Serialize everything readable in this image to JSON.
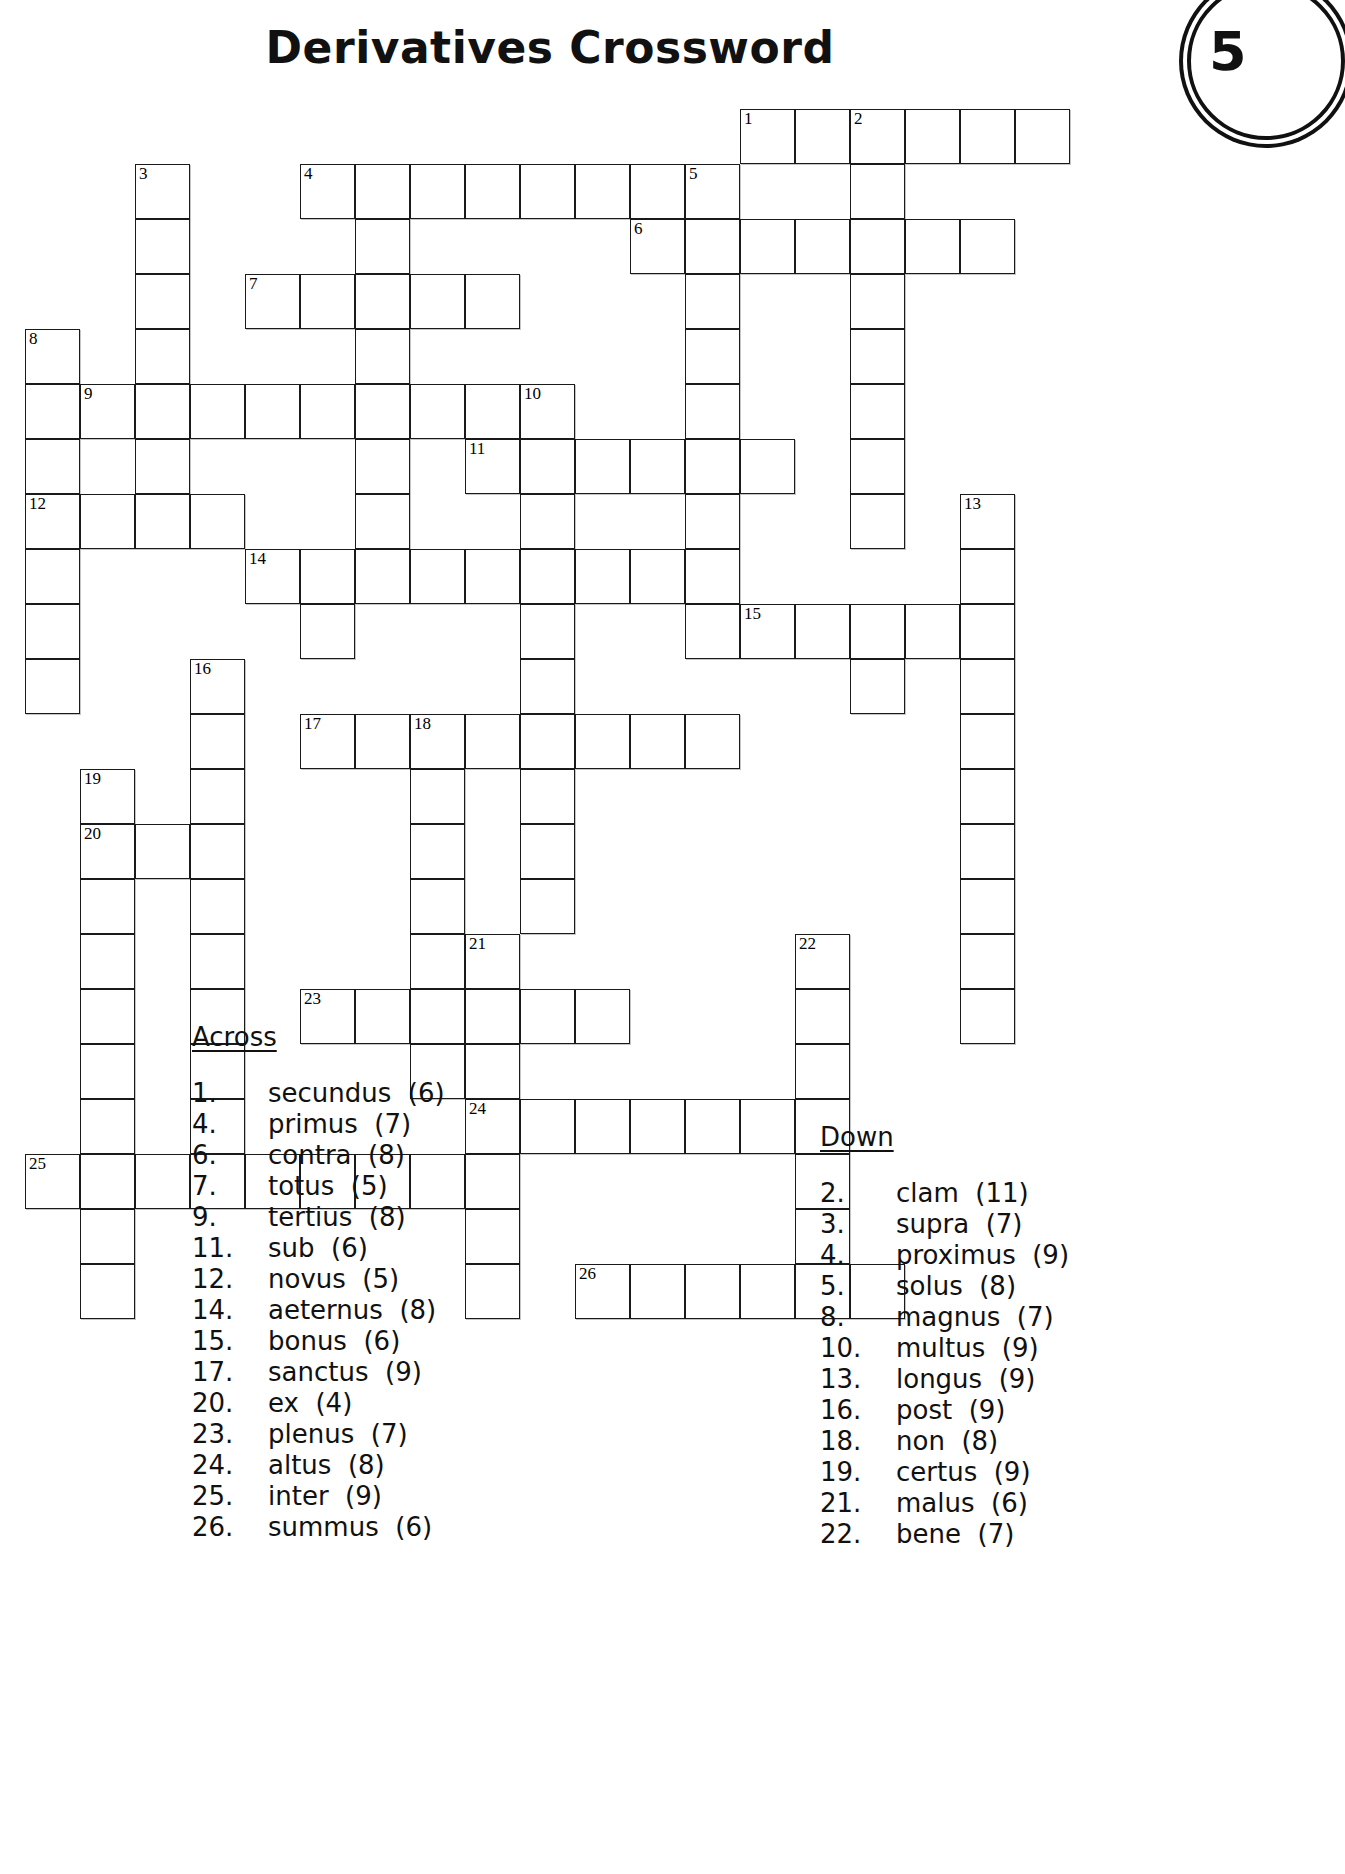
{
  "title": "Derivatives Crossword",
  "page_badge": "5",
  "headings": {
    "across": "Across",
    "down": "Down"
  },
  "grid": {
    "cell_size": 55,
    "origin": {
      "x": 25,
      "y": 109
    },
    "cells": [
      {
        "c": 13,
        "r": 0,
        "n": "1"
      },
      {
        "c": 14,
        "r": 0
      },
      {
        "c": 15,
        "r": 0,
        "n": "2"
      },
      {
        "c": 16,
        "r": 0
      },
      {
        "c": 17,
        "r": 0
      },
      {
        "c": 18,
        "r": 0
      },
      {
        "c": 2,
        "r": 1,
        "n": "3"
      },
      {
        "c": 5,
        "r": 1,
        "n": "4"
      },
      {
        "c": 6,
        "r": 1
      },
      {
        "c": 7,
        "r": 1
      },
      {
        "c": 8,
        "r": 1
      },
      {
        "c": 9,
        "r": 1
      },
      {
        "c": 10,
        "r": 1
      },
      {
        "c": 11,
        "r": 1
      },
      {
        "c": 12,
        "r": 1,
        "n": "5"
      },
      {
        "c": 15,
        "r": 1
      },
      {
        "c": 2,
        "r": 2
      },
      {
        "c": 6,
        "r": 2
      },
      {
        "c": 11,
        "r": 2,
        "n": "6"
      },
      {
        "c": 12,
        "r": 2
      },
      {
        "c": 13,
        "r": 2
      },
      {
        "c": 14,
        "r": 2
      },
      {
        "c": 15,
        "r": 2
      },
      {
        "c": 16,
        "r": 2
      },
      {
        "c": 17,
        "r": 2
      },
      {
        "c": 2,
        "r": 3
      },
      {
        "c": 4,
        "r": 3,
        "n": "7"
      },
      {
        "c": 5,
        "r": 3
      },
      {
        "c": 6,
        "r": 3
      },
      {
        "c": 7,
        "r": 3
      },
      {
        "c": 8,
        "r": 3
      },
      {
        "c": 12,
        "r": 3
      },
      {
        "c": 15,
        "r": 3
      },
      {
        "c": 0,
        "r": 4,
        "n": "8"
      },
      {
        "c": 2,
        "r": 4
      },
      {
        "c": 6,
        "r": 4
      },
      {
        "c": 12,
        "r": 4
      },
      {
        "c": 15,
        "r": 4
      },
      {
        "c": 0,
        "r": 5
      },
      {
        "c": 1,
        "r": 5,
        "n": "9"
      },
      {
        "c": 2,
        "r": 5
      },
      {
        "c": 3,
        "r": 5
      },
      {
        "c": 4,
        "r": 5
      },
      {
        "c": 5,
        "r": 5
      },
      {
        "c": 6,
        "r": 5
      },
      {
        "c": 7,
        "r": 5
      },
      {
        "c": 8,
        "r": 5
      },
      {
        "c": 9,
        "r": 5,
        "n": "10"
      },
      {
        "c": 12,
        "r": 5
      },
      {
        "c": 15,
        "r": 5
      },
      {
        "c": 0,
        "r": 6
      },
      {
        "c": 2,
        "r": 6
      },
      {
        "c": 6,
        "r": 6
      },
      {
        "c": 8,
        "r": 6,
        "n": "11"
      },
      {
        "c": 9,
        "r": 6
      },
      {
        "c": 10,
        "r": 6
      },
      {
        "c": 11,
        "r": 6
      },
      {
        "c": 12,
        "r": 6
      },
      {
        "c": 13,
        "r": 6
      },
      {
        "c": 15,
        "r": 6
      },
      {
        "c": 0,
        "r": 7,
        "n": "12"
      },
      {
        "c": 1,
        "r": 7
      },
      {
        "c": 2,
        "r": 7
      },
      {
        "c": 3,
        "r": 7
      },
      {
        "c": 6,
        "r": 7
      },
      {
        "c": 9,
        "r": 7
      },
      {
        "c": 12,
        "r": 7
      },
      {
        "c": 15,
        "r": 7
      },
      {
        "c": 17,
        "r": 7,
        "n": "13"
      },
      {
        "c": 0,
        "r": 8
      },
      {
        "c": 4,
        "r": 8,
        "n": "14"
      },
      {
        "c": 5,
        "r": 8
      },
      {
        "c": 6,
        "r": 8
      },
      {
        "c": 7,
        "r": 8
      },
      {
        "c": 8,
        "r": 8
      },
      {
        "c": 9,
        "r": 8
      },
      {
        "c": 10,
        "r": 8
      },
      {
        "c": 11,
        "r": 8
      },
      {
        "c": 12,
        "r": 8
      },
      {
        "c": 17,
        "r": 8
      },
      {
        "c": 0,
        "r": 9
      },
      {
        "c": 5,
        "r": 9
      },
      {
        "c": 9,
        "r": 9
      },
      {
        "c": 12,
        "r": 9
      },
      {
        "c": 13,
        "r": 9,
        "n": "15"
      },
      {
        "c": 14,
        "r": 9
      },
      {
        "c": 15,
        "r": 9
      },
      {
        "c": 16,
        "r": 9
      },
      {
        "c": 17,
        "r": 9
      },
      {
        "c": 0,
        "r": 10
      },
      {
        "c": 3,
        "r": 10,
        "n": "16"
      },
      {
        "c": 9,
        "r": 10
      },
      {
        "c": 15,
        "r": 10
      },
      {
        "c": 17,
        "r": 10
      },
      {
        "c": 3,
        "r": 11
      },
      {
        "c": 5,
        "r": 11,
        "n": "17"
      },
      {
        "c": 6,
        "r": 11
      },
      {
        "c": 7,
        "r": 11,
        "n": "18"
      },
      {
        "c": 8,
        "r": 11
      },
      {
        "c": 9,
        "r": 11
      },
      {
        "c": 10,
        "r": 11
      },
      {
        "c": 11,
        "r": 11
      },
      {
        "c": 12,
        "r": 11
      },
      {
        "c": 17,
        "r": 11
      },
      {
        "c": 1,
        "r": 12,
        "n": "19"
      },
      {
        "c": 3,
        "r": 12
      },
      {
        "c": 7,
        "r": 12
      },
      {
        "c": 9,
        "r": 12
      },
      {
        "c": 17,
        "r": 12
      },
      {
        "c": 1,
        "r": 13,
        "n": "20"
      },
      {
        "c": 2,
        "r": 13
      },
      {
        "c": 3,
        "r": 13
      },
      {
        "c": 7,
        "r": 13
      },
      {
        "c": 9,
        "r": 13
      },
      {
        "c": 17,
        "r": 13
      },
      {
        "c": 1,
        "r": 14
      },
      {
        "c": 3,
        "r": 14
      },
      {
        "c": 7,
        "r": 14
      },
      {
        "c": 9,
        "r": 14
      },
      {
        "c": 17,
        "r": 14
      },
      {
        "c": 1,
        "r": 15
      },
      {
        "c": 3,
        "r": 15
      },
      {
        "c": 7,
        "r": 15
      },
      {
        "c": 8,
        "r": 15,
        "n": "21"
      },
      {
        "c": 14,
        "r": 15,
        "n": "22"
      },
      {
        "c": 17,
        "r": 15
      },
      {
        "c": 1,
        "r": 16
      },
      {
        "c": 3,
        "r": 16
      },
      {
        "c": 5,
        "r": 16,
        "n": "23"
      },
      {
        "c": 6,
        "r": 16
      },
      {
        "c": 7,
        "r": 16
      },
      {
        "c": 8,
        "r": 16
      },
      {
        "c": 9,
        "r": 16
      },
      {
        "c": 10,
        "r": 16
      },
      {
        "c": 14,
        "r": 16
      },
      {
        "c": 17,
        "r": 16
      },
      {
        "c": 1,
        "r": 17
      },
      {
        "c": 3,
        "r": 17
      },
      {
        "c": 7,
        "r": 17
      },
      {
        "c": 8,
        "r": 17
      },
      {
        "c": 14,
        "r": 17
      },
      {
        "c": 1,
        "r": 18
      },
      {
        "c": 3,
        "r": 18
      },
      {
        "c": 8,
        "r": 18,
        "n": "24"
      },
      {
        "c": 9,
        "r": 18
      },
      {
        "c": 10,
        "r": 18
      },
      {
        "c": 11,
        "r": 18
      },
      {
        "c": 12,
        "r": 18
      },
      {
        "c": 13,
        "r": 18
      },
      {
        "c": 14,
        "r": 18
      },
      {
        "c": 0,
        "r": 19,
        "n": "25"
      },
      {
        "c": 1,
        "r": 19
      },
      {
        "c": 2,
        "r": 19
      },
      {
        "c": 3,
        "r": 19
      },
      {
        "c": 4,
        "r": 19
      },
      {
        "c": 5,
        "r": 19
      },
      {
        "c": 6,
        "r": 19
      },
      {
        "c": 7,
        "r": 19
      },
      {
        "c": 8,
        "r": 19
      },
      {
        "c": 14,
        "r": 19
      },
      {
        "c": 1,
        "r": 20
      },
      {
        "c": 8,
        "r": 20
      },
      {
        "c": 14,
        "r": 20
      },
      {
        "c": 1,
        "r": 21
      },
      {
        "c": 8,
        "r": 21
      },
      {
        "c": 10,
        "r": 21,
        "n": "26"
      },
      {
        "c": 11,
        "r": 21
      },
      {
        "c": 12,
        "r": 21
      },
      {
        "c": 13,
        "r": 21
      },
      {
        "c": 14,
        "r": 21
      },
      {
        "c": 15,
        "r": 21
      }
    ]
  },
  "across_clues": [
    {
      "num": "1.",
      "text": "secundus  (6)"
    },
    {
      "num": "4.",
      "text": "primus  (7)"
    },
    {
      "num": "6.",
      "text": "contra  (8)"
    },
    {
      "num": "7.",
      "text": "totus  (5)"
    },
    {
      "num": "9.",
      "text": "tertius  (8)"
    },
    {
      "num": "11.",
      "text": "sub  (6)"
    },
    {
      "num": "12.",
      "text": "novus  (5)"
    },
    {
      "num": "14.",
      "text": "aeternus  (8)"
    },
    {
      "num": "15.",
      "text": "bonus  (6)"
    },
    {
      "num": "17.",
      "text": "sanctus  (9)"
    },
    {
      "num": "20.",
      "text": "ex  (4)"
    },
    {
      "num": "23.",
      "text": "plenus  (7)"
    },
    {
      "num": "24.",
      "text": "altus  (8)"
    },
    {
      "num": "25.",
      "text": "inter  (9)"
    },
    {
      "num": "26.",
      "text": "summus  (6)"
    }
  ],
  "down_clues": [
    {
      "num": "2.",
      "text": "clam  (11)"
    },
    {
      "num": "3.",
      "text": "supra  (7)"
    },
    {
      "num": "4.",
      "text": "proximus  (9)"
    },
    {
      "num": "5.",
      "text": "solus  (8)"
    },
    {
      "num": "8.",
      "text": "magnus  (7)"
    },
    {
      "num": "10.",
      "text": "multus  (9)"
    },
    {
      "num": "13.",
      "text": "longus  (9)"
    },
    {
      "num": "16.",
      "text": "post  (9)"
    },
    {
      "num": "18.",
      "text": "non  (8)"
    },
    {
      "num": "19.",
      "text": "certus  (9)"
    },
    {
      "num": "21.",
      "text": "malus  (6)"
    },
    {
      "num": "22.",
      "text": "bene  (7)"
    }
  ]
}
